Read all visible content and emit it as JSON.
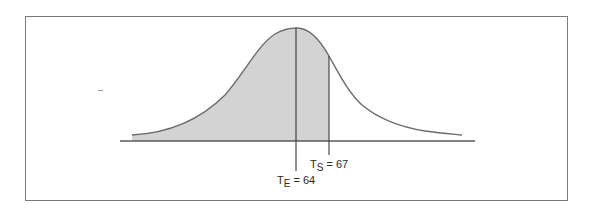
{
  "figure": {
    "marker": "3",
    "curve": {
      "type": "normal-distribution",
      "peak_x": 297,
      "shade_color": "#d3d3d3",
      "line_color": "#6a6a6a"
    },
    "markers": [
      {
        "id": "te",
        "symbol": "T",
        "subscript": "E",
        "value_text": "= 64",
        "value": 64
      },
      {
        "id": "ts",
        "symbol": "T",
        "subscript": "S",
        "value_text": "= 67",
        "value": 67
      }
    ],
    "shaded_region": "area under curve from left tail up to T_S = 67"
  }
}
